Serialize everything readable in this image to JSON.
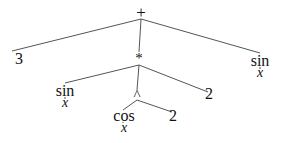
{
  "diagram": {
    "type": "expression-tree",
    "expression": "3 + (sin(x) * cos(x)^2) * 2 + sin(x)",
    "nodes": {
      "root": {
        "label": "+"
      },
      "three": {
        "label": "3"
      },
      "mul": {
        "label": "*"
      },
      "sin_right": {
        "label": "sin",
        "arg": "x"
      },
      "sin_left": {
        "label": "sin",
        "arg": "x"
      },
      "pow": {
        "label": "^"
      },
      "two_mul": {
        "label": "2"
      },
      "cos": {
        "label": "cos",
        "arg": "x"
      },
      "two_pow": {
        "label": "2"
      }
    },
    "edges": [
      [
        "root",
        "three"
      ],
      [
        "root",
        "mul"
      ],
      [
        "root",
        "sin_right"
      ],
      [
        "mul",
        "sin_left"
      ],
      [
        "mul",
        "pow"
      ],
      [
        "mul",
        "two_mul"
      ],
      [
        "pow",
        "cos"
      ],
      [
        "pow",
        "two_pow"
      ]
    ],
    "line_color": "#555555",
    "text_color": "#111111"
  }
}
